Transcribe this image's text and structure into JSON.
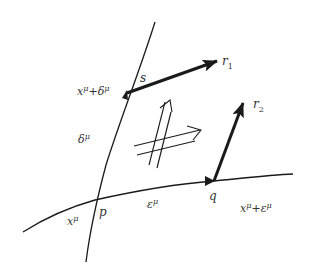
{
  "diagram": {
    "type": "parallel-transport-geodesic-figure",
    "colors": {
      "stroke": "#1a1a1a",
      "text": "#333333",
      "background": "#ffffff"
    },
    "points": {
      "p": {
        "label": "p",
        "coord_label_base": "x",
        "coord_label_sup": "μ"
      },
      "q": {
        "label": "q",
        "coord_label_base": "x",
        "coord_label_sup1": "μ",
        "coord_label_op": "+ε",
        "coord_label_sup2": "μ"
      },
      "s": {
        "label": "s",
        "coord_label_base": "x",
        "coord_label_sup1": "μ",
        "coord_label_op": "+δ",
        "coord_label_sup2": "μ"
      }
    },
    "displacements": {
      "delta": {
        "base": "δ",
        "sup": "μ"
      },
      "epsilon": {
        "base": "ε",
        "sup": "μ"
      }
    },
    "vectors": {
      "r1": {
        "base": "r",
        "sub": "1"
      },
      "r2": {
        "base": "r",
        "sub": "2"
      }
    },
    "center_symbol": "double-arrow-pair (parallel transport)"
  }
}
